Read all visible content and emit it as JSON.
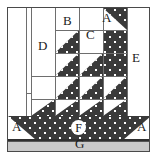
{
  "diagram": {
    "frame": {
      "x": 7,
      "y": 7,
      "width": 143,
      "height": 145,
      "border_color": "#4a4a4a"
    },
    "colors": {
      "fabric_dark": "#3a3a3a",
      "fabric_dot": "#ffffff",
      "background": "#ffffff",
      "ground": "#c9c9c9",
      "grid_line": "#6e6e6e",
      "label_text": "#1a1a1a"
    },
    "labels": [
      {
        "id": "A-top",
        "text": "A",
        "x": 101,
        "y": 10,
        "part": "A"
      },
      {
        "id": "B",
        "text": "B",
        "x": 62,
        "y": 13,
        "part": "B"
      },
      {
        "id": "C",
        "text": "C",
        "x": 85,
        "y": 27,
        "part": "C"
      },
      {
        "id": "D",
        "text": "D",
        "x": 37,
        "y": 38,
        "part": "D"
      },
      {
        "id": "E",
        "text": "E",
        "x": 131,
        "y": 50,
        "part": "E"
      },
      {
        "id": "F",
        "text": "F",
        "x": 70,
        "y": 110,
        "part": "F"
      },
      {
        "id": "A-left",
        "text": "A",
        "x": 11,
        "y": 119,
        "part": "A"
      },
      {
        "id": "A-right",
        "text": "A",
        "x": 136,
        "y": 119,
        "part": "A"
      },
      {
        "id": "G",
        "text": "G",
        "x": 74,
        "y": 135,
        "part": "G"
      }
    ],
    "parts": [
      {
        "letter": "A",
        "role": "small corner triangle",
        "count": 3
      },
      {
        "letter": "B",
        "role": "small background square",
        "count": 1
      },
      {
        "letter": "C",
        "role": "background rectangle",
        "count": 1
      },
      {
        "letter": "D",
        "role": "background rectangle",
        "count": 1
      },
      {
        "letter": "E",
        "role": "background rectangle",
        "count": 1
      },
      {
        "letter": "F",
        "role": "boat hull",
        "count": 1
      },
      {
        "letter": "G",
        "role": "bottom ground strip",
        "count": 1
      }
    ]
  }
}
